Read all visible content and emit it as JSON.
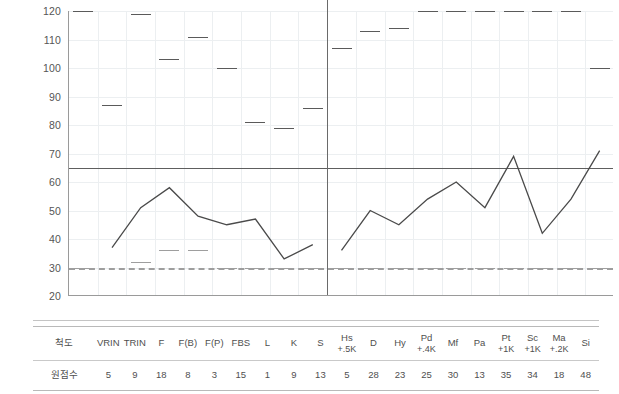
{
  "chart_data": {
    "type": "line",
    "title": "",
    "xlabel": "",
    "ylabel": "",
    "ylim": [
      20,
      120
    ],
    "yticks": [
      120,
      110,
      100,
      90,
      80,
      70,
      60,
      50,
      40,
      30,
      20
    ],
    "ytick_labels": [
      "120",
      "110",
      "100",
      "90",
      "80",
      "70",
      "60",
      "50",
      "40",
      "30",
      "20"
    ],
    "grid": true,
    "legend": "none",
    "reference_lines": [
      {
        "value": 65,
        "style": "solid",
        "color": "#5e5e5e",
        "label": ""
      },
      {
        "value": 30,
        "style": "dashed",
        "color": "#9e9e9e",
        "label": ""
      }
    ],
    "group_divider_after_category": "S",
    "categories": [
      "VRIN",
      "TRIN",
      "F",
      "F(B)",
      "F(P)",
      "FBS",
      "L",
      "K",
      "S",
      "Hs",
      "D",
      "Hy",
      "Pd",
      "Mf",
      "Pa",
      "Pt",
      "Sc",
      "Ma",
      "Si"
    ],
    "series": [
      {
        "name": "T-score (line)",
        "type": "line",
        "color": "#4a4a4a",
        "segments": [
          {
            "categories": [
              "TRIN",
              "F",
              "F(B)",
              "F(P)",
              "FBS",
              "L",
              "K",
              "S"
            ],
            "values": [
              37,
              51,
              58,
              48,
              45,
              47,
              33,
              38,
              33
            ]
          },
          {
            "categories": [
              "Hs",
              "D",
              "Hy",
              "Pd",
              "Mf",
              "Pa",
              "Pt",
              "Sc",
              "Ma",
              "Si"
            ],
            "values": [
              36,
              50,
              45,
              54,
              60,
              51,
              69,
              42,
              54,
              71
            ]
          }
        ],
        "values": [
          37,
          51,
          58,
          48,
          45,
          47,
          33,
          38,
          33,
          36,
          50,
          45,
          54,
          60,
          51,
          69,
          42,
          54,
          71
        ]
      },
      {
        "name": "Upper marker (dash)",
        "type": "marker-dash",
        "color": "#5a5a5a",
        "values": [
          120,
          87,
          119,
          103,
          111,
          100,
          81,
          79,
          86,
          107,
          113,
          114,
          120,
          120,
          120,
          120,
          120,
          120,
          100
        ]
      },
      {
        "name": "Lower marker (dash)",
        "type": "marker-dash",
        "color": "#9e9e9e",
        "values": [
          30,
          null,
          32,
          36,
          36,
          30,
          30,
          30,
          30,
          30,
          30,
          30,
          30,
          30,
          30,
          30,
          30,
          30,
          30
        ]
      }
    ]
  },
  "table": {
    "row_labels": [
      "척도",
      "원점수"
    ],
    "scales": [
      {
        "name": "VRIN",
        "sub": "",
        "raw": "5"
      },
      {
        "name": "TRIN",
        "sub": "",
        "raw": "9"
      },
      {
        "name": "F",
        "sub": "",
        "raw": "18"
      },
      {
        "name": "F(B)",
        "sub": "",
        "raw": "8"
      },
      {
        "name": "F(P)",
        "sub": "",
        "raw": "3"
      },
      {
        "name": "FBS",
        "sub": "",
        "raw": "15"
      },
      {
        "name": "L",
        "sub": "",
        "raw": "1"
      },
      {
        "name": "K",
        "sub": "",
        "raw": "9"
      },
      {
        "name": "S",
        "sub": "",
        "raw": "13"
      },
      {
        "name": "Hs",
        "sub": "+.5K",
        "raw": "5"
      },
      {
        "name": "D",
        "sub": "",
        "raw": "28"
      },
      {
        "name": "Hy",
        "sub": "",
        "raw": "23"
      },
      {
        "name": "Pd",
        "sub": "+.4K",
        "raw": "25"
      },
      {
        "name": "Mf",
        "sub": "",
        "raw": "30"
      },
      {
        "name": "Pa",
        "sub": "",
        "raw": "13"
      },
      {
        "name": "Pt",
        "sub": "+1K",
        "raw": "35"
      },
      {
        "name": "Sc",
        "sub": "+1K",
        "raw": "34"
      },
      {
        "name": "Ma",
        "sub": "+.2K",
        "raw": "18"
      },
      {
        "name": "Si",
        "sub": "",
        "raw": "48"
      }
    ]
  },
  "colors": {
    "line": "#4a4a4a",
    "marker_upper": "#5a5a5a",
    "marker_lower": "#9e9e9e",
    "grid": "#eceff1",
    "axis": "#9a9a9a",
    "reference": "#5e5e5e",
    "background": "#ffffff"
  }
}
